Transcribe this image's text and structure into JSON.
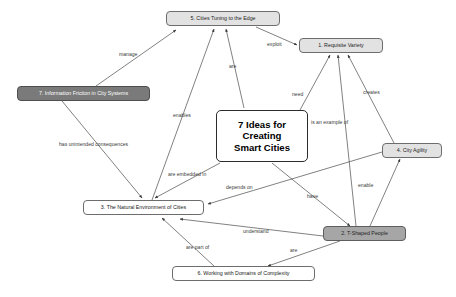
{
  "diagram": {
    "title": "7 Ideas for Creating Smart Cities",
    "type": "concept-map",
    "background_color": "#ffffff",
    "line_color": "#4a4a4a"
  },
  "center": {
    "line1": "7 Ideas for",
    "line2": "Creating",
    "line3": "Smart Cities"
  },
  "nodes": [
    {
      "id": "n5",
      "label": "5. Cities Tuning to the Edge",
      "style": "light",
      "fill": "#e2e2e2",
      "x": 166,
      "y": 11,
      "w": 114,
      "h": 15
    },
    {
      "id": "n1",
      "label": "1. Requisite Variety",
      "style": "light",
      "fill": "#e2e2e2",
      "x": 299,
      "y": 38,
      "w": 84,
      "h": 15
    },
    {
      "id": "n7",
      "label": "7. Information Friction in City Systems",
      "style": "dark",
      "fill": "#7a7a7a",
      "x": 17,
      "y": 86,
      "w": 133,
      "h": 15
    },
    {
      "id": "n4",
      "label": "4. City Agility",
      "style": "light",
      "fill": "#e2e2e2",
      "x": 382,
      "y": 143,
      "w": 60,
      "h": 15
    },
    {
      "id": "n3",
      "label": "3. The Natural Environment of Cities",
      "style": "white",
      "fill": "#ffffff",
      "x": 83,
      "y": 200,
      "w": 121,
      "h": 15
    },
    {
      "id": "n2",
      "label": "2. T-Shaped People",
      "style": "mid",
      "fill": "#a6a6a6",
      "x": 323,
      "y": 226,
      "w": 83,
      "h": 15
    },
    {
      "id": "n6",
      "label": "6. Working with Domains of Complexity",
      "style": "white",
      "fill": "#ffffff",
      "x": 172,
      "y": 266,
      "w": 143,
      "h": 15
    }
  ],
  "edge_labels": [
    {
      "id": "e-manage",
      "text": "manage",
      "x": 119,
      "y": 56
    },
    {
      "id": "e-exploit",
      "text": "exploit",
      "x": 267,
      "y": 46
    },
    {
      "id": "e-are-top",
      "text": "are",
      "x": 229,
      "y": 68
    },
    {
      "id": "e-need",
      "text": "need",
      "x": 292,
      "y": 96
    },
    {
      "id": "e-creates",
      "text": "creates",
      "x": 363,
      "y": 94
    },
    {
      "id": "e-enables",
      "text": "enables",
      "x": 173,
      "y": 117
    },
    {
      "id": "e-is-an-example-of",
      "text": "is an example of",
      "x": 311,
      "y": 124
    },
    {
      "id": "e-has-unintended-consequences",
      "text": "has unintended consequences",
      "x": 59,
      "y": 146
    },
    {
      "id": "e-are-embedded-in",
      "text": "are embedded in",
      "x": 168,
      "y": 176
    },
    {
      "id": "e-depends-on",
      "text": "depends on",
      "x": 226,
      "y": 189
    },
    {
      "id": "e-have",
      "text": "have",
      "x": 307,
      "y": 198
    },
    {
      "id": "e-enable",
      "text": "enable",
      "x": 358,
      "y": 187
    },
    {
      "id": "e-understand",
      "text": "understand",
      "x": 243,
      "y": 233
    },
    {
      "id": "e-are-part-of",
      "text": "are part of",
      "x": 186,
      "y": 249
    },
    {
      "id": "e-are-bottom",
      "text": "are",
      "x": 290,
      "y": 252
    }
  ],
  "edges": [
    {
      "from": "7. Information Friction in City Systems",
      "to": "5. Cities Tuning to the Edge",
      "label": "manage"
    },
    {
      "from": "5. Cities Tuning to the Edge",
      "to": "1. Requisite Variety",
      "label": "exploit"
    },
    {
      "from": "7 Ideas for Creating Smart Cities",
      "to": "5. Cities Tuning to the Edge",
      "label": "are"
    },
    {
      "from": "7 Ideas for Creating Smart Cities",
      "to": "1. Requisite Variety",
      "label": "need"
    },
    {
      "from": "4. City Agility",
      "to": "1. Requisite Variety",
      "label": "creates"
    },
    {
      "from": "3. The Natural Environment of Cities",
      "to": "5. Cities Tuning to the Edge",
      "label": "enables"
    },
    {
      "from": "2. T-Shaped People",
      "to": "1. Requisite Variety",
      "label": "is an example of"
    },
    {
      "from": "7. Information Friction in City Systems",
      "to": "3. The Natural Environment of Cities",
      "label": "has unintended consequences"
    },
    {
      "from": "7 Ideas for Creating Smart Cities",
      "to": "3. The Natural Environment of Cities",
      "label": "are embedded in"
    },
    {
      "from": "4. City Agility",
      "to": "3. The Natural Environment of Cities",
      "label": "depends on"
    },
    {
      "from": "7 Ideas for Creating Smart Cities",
      "to": "2. T-Shaped People",
      "label": "have"
    },
    {
      "from": "2. T-Shaped People",
      "to": "4. City Agility",
      "label": "enable"
    },
    {
      "from": "2. T-Shaped People",
      "to": "3. The Natural Environment of Cities",
      "label": "understand"
    },
    {
      "from": "6. Working with Domains of Complexity",
      "to": "3. The Natural Environment of Cities",
      "label": "are part of"
    },
    {
      "from": "2. T-Shaped People",
      "to": "6. Working with Domains of Complexity",
      "label": "are"
    }
  ]
}
